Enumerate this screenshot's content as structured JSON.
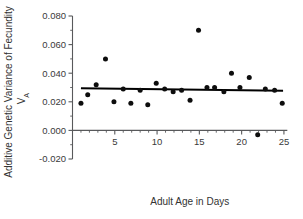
{
  "chart_data": {
    "type": "scatter",
    "title": "",
    "xlabel": "Adult Age in Days",
    "ylabel": "Additive Genetic Variance of Fecundity",
    "ylabel_subscript": "V",
    "ylabel_subscript_sub": "A",
    "xlim": [
      0,
      25.6
    ],
    "ylim": [
      -0.02,
      0.08
    ],
    "grid": false,
    "legend": false,
    "x_ticks": [
      5,
      10,
      15,
      20,
      25
    ],
    "x_tick_labels": [
      "5",
      "10",
      "15",
      "20",
      "25"
    ],
    "x_minor_tick_step": 1,
    "y_ticks": [
      -0.02,
      0.0,
      0.02,
      0.04,
      0.06,
      0.08
    ],
    "y_tick_labels": [
      "-0.020",
      "0.000",
      "0.020",
      "0.040",
      "0.060",
      "0.080"
    ],
    "y_minor_tick_step": 0.01,
    "marker": "filled-circle",
    "marker_color": "#0d0d0d",
    "points": [
      {
        "x": 1.0,
        "y": 0.019
      },
      {
        "x": 1.8,
        "y": 0.025
      },
      {
        "x": 2.8,
        "y": 0.032
      },
      {
        "x": 3.9,
        "y": 0.05
      },
      {
        "x": 4.9,
        "y": 0.02
      },
      {
        "x": 6.0,
        "y": 0.029
      },
      {
        "x": 6.9,
        "y": 0.019
      },
      {
        "x": 8.0,
        "y": 0.028
      },
      {
        "x": 8.9,
        "y": 0.018
      },
      {
        "x": 9.9,
        "y": 0.033
      },
      {
        "x": 10.9,
        "y": 0.029
      },
      {
        "x": 11.9,
        "y": 0.027
      },
      {
        "x": 12.9,
        "y": 0.028
      },
      {
        "x": 13.9,
        "y": 0.021
      },
      {
        "x": 14.9,
        "y": 0.07
      },
      {
        "x": 15.9,
        "y": 0.03
      },
      {
        "x": 16.8,
        "y": 0.03
      },
      {
        "x": 17.9,
        "y": 0.027
      },
      {
        "x": 18.8,
        "y": 0.04
      },
      {
        "x": 19.8,
        "y": 0.03
      },
      {
        "x": 20.9,
        "y": 0.037
      },
      {
        "x": 21.9,
        "y": -0.003
      },
      {
        "x": 22.8,
        "y": 0.029
      },
      {
        "x": 23.9,
        "y": 0.028
      },
      {
        "x": 24.8,
        "y": 0.019
      }
    ],
    "trendline": {
      "x_start": 1.0,
      "y_start": 0.0295,
      "x_end": 24.9,
      "y_end": 0.0277,
      "color": "#000000"
    }
  }
}
